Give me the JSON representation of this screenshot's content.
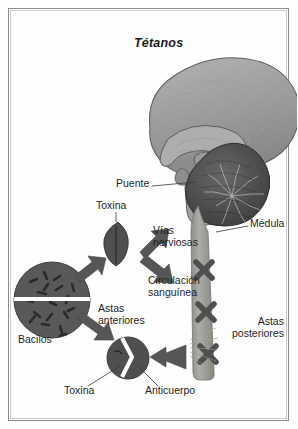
{
  "document": {
    "title": "Tétanos",
    "subject": "tetanus-pathogenesis-diagram",
    "language": "es"
  },
  "frame": {
    "border_color": "#8b8d8c",
    "background_color": "#fefefe"
  },
  "palette": {
    "dark_gray": "#4a4a4a",
    "mid_gray": "#6e6e6e",
    "light_gray": "#9a9a9a",
    "brain_fill": "#9d9d9d",
    "brain_shade": "#7d7d7d",
    "cord_fill": "#9b9b97",
    "text": "#1f1f1f",
    "white": "#ffffff"
  },
  "labels": [
    {
      "id": "puente",
      "text": "Puente",
      "x": 116,
      "y": 184,
      "align": "left"
    },
    {
      "id": "toxina-top",
      "text": "Toxina",
      "x": 96,
      "y": 206,
      "align": "left"
    },
    {
      "id": "vias-nerviosas",
      "text": "Vías\nnerviosas",
      "x": 153,
      "y": 231,
      "align": "left"
    },
    {
      "id": "circulacion",
      "text": "Circulación\nsanguínea",
      "x": 148,
      "y": 281,
      "align": "left"
    },
    {
      "id": "medula",
      "text": "Médula",
      "x": 250,
      "y": 224,
      "align": "left"
    },
    {
      "id": "astas-anteriores",
      "text": "Astas\nanteriores",
      "x": 98,
      "y": 309,
      "align": "left"
    },
    {
      "id": "astas-posteriores",
      "text": "Astas\nposteriores",
      "x": 258,
      "y": 322,
      "align": "left"
    },
    {
      "id": "bacilos",
      "text": "Bacilos",
      "x": 18,
      "y": 340,
      "align": "left"
    },
    {
      "id": "toxina-bottom",
      "text": "Toxina",
      "x": 64,
      "y": 391,
      "align": "left"
    },
    {
      "id": "anticuerpo",
      "text": "Anticuerpo",
      "x": 145,
      "y": 391,
      "align": "left"
    }
  ],
  "anatomy": {
    "brain": {
      "name": "midsagittal-brain-section",
      "parts": [
        "cerebro",
        "cuerpo calloso",
        "cerebelo",
        "tronco encefálico",
        "puente"
      ]
    },
    "spinal_cord": {
      "name": "medula-espinal",
      "lesion_marks": 3,
      "lesion_symbol": "X"
    }
  },
  "elements": {
    "bacilli_circle": {
      "name": "bacilos-colonia",
      "rod_count": 18
    },
    "toxin_particle": {
      "name": "toxina-particula",
      "shape": "lens"
    },
    "antibody_cell": {
      "name": "anticuerpo-toxina-union",
      "shape": "split-circle"
    },
    "arrows": [
      {
        "name": "arrow-bacilos-to-toxina",
        "direction": "up-right"
      },
      {
        "name": "arrow-bacilos-to-astas",
        "direction": "down-right"
      },
      {
        "name": "arrow-to-vias-nerviosas",
        "direction": "up-right"
      },
      {
        "name": "arrow-to-circulacion",
        "direction": "down-right"
      },
      {
        "name": "arrow-to-astas-anteriores",
        "direction": "left"
      }
    ]
  }
}
